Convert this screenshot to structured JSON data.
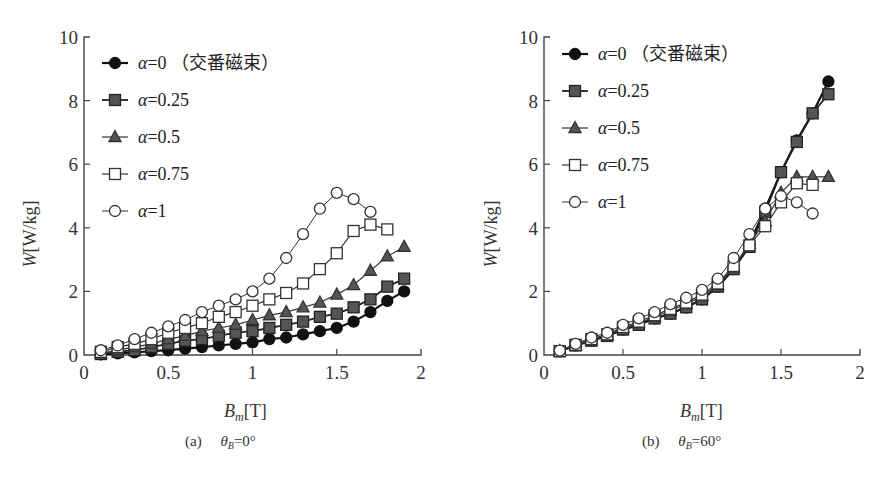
{
  "chart_data": [
    {
      "type": "line",
      "id": "a",
      "caption": "(a)",
      "caption_param_symbol": "θ",
      "caption_param_sub": "B",
      "caption_param_value": "=0°",
      "xlabel_main": "B",
      "xlabel_sub": "m",
      "xlabel_unit": "[T]",
      "ylabel_main": "W",
      "ylabel_unit": "[W/kg]",
      "xlim": [
        0,
        2
      ],
      "ylim": [
        0,
        10
      ],
      "xticks": [
        "0",
        "0.5",
        "1",
        "1.5",
        "2"
      ],
      "yticks": [
        "0",
        "2",
        "4",
        "6",
        "8",
        "10"
      ],
      "grid": false,
      "legend_position": "upper-left",
      "series": [
        {
          "name": "α=0 (交番磁束)",
          "marker": "filled-circle",
          "x": [
            0.1,
            0.2,
            0.3,
            0.4,
            0.5,
            0.6,
            0.7,
            0.8,
            0.9,
            1.0,
            1.1,
            1.2,
            1.3,
            1.4,
            1.5,
            1.6,
            1.7,
            1.8,
            1.9
          ],
          "values": [
            0.02,
            0.05,
            0.08,
            0.12,
            0.15,
            0.2,
            0.25,
            0.3,
            0.35,
            0.4,
            0.5,
            0.55,
            0.65,
            0.75,
            0.85,
            1.05,
            1.35,
            1.7,
            2.0
          ]
        },
        {
          "name": "α=0.25",
          "marker": "filled-square",
          "x": [
            0.1,
            0.2,
            0.3,
            0.4,
            0.5,
            0.6,
            0.7,
            0.8,
            0.9,
            1.0,
            1.1,
            1.2,
            1.3,
            1.4,
            1.5,
            1.6,
            1.7,
            1.8,
            1.9
          ],
          "values": [
            0.03,
            0.1,
            0.15,
            0.25,
            0.35,
            0.45,
            0.5,
            0.6,
            0.7,
            0.75,
            0.85,
            0.95,
            1.05,
            1.2,
            1.3,
            1.5,
            1.75,
            2.15,
            2.4
          ]
        },
        {
          "name": "α=0.5",
          "marker": "filled-triangle",
          "x": [
            0.1,
            0.2,
            0.3,
            0.4,
            0.5,
            0.6,
            0.7,
            0.8,
            0.9,
            1.0,
            1.1,
            1.2,
            1.3,
            1.4,
            1.5,
            1.6,
            1.7,
            1.8,
            1.9
          ],
          "values": [
            0.05,
            0.15,
            0.25,
            0.35,
            0.5,
            0.6,
            0.75,
            0.85,
            0.95,
            1.1,
            1.25,
            1.35,
            1.5,
            1.65,
            1.9,
            2.2,
            2.65,
            3.1,
            3.4
          ]
        },
        {
          "name": "α=0.75",
          "marker": "open-square",
          "x": [
            0.1,
            0.2,
            0.3,
            0.4,
            0.5,
            0.6,
            0.7,
            0.8,
            0.9,
            1.0,
            1.1,
            1.2,
            1.3,
            1.4,
            1.5,
            1.6,
            1.7,
            1.8
          ],
          "values": [
            0.1,
            0.25,
            0.35,
            0.5,
            0.7,
            0.85,
            1.0,
            1.2,
            1.35,
            1.55,
            1.75,
            1.95,
            2.25,
            2.7,
            3.2,
            3.9,
            4.1,
            3.95
          ]
        },
        {
          "name": "α=1",
          "marker": "open-circle",
          "x": [
            0.1,
            0.2,
            0.3,
            0.4,
            0.5,
            0.6,
            0.7,
            0.8,
            0.9,
            1.0,
            1.1,
            1.2,
            1.3,
            1.4,
            1.5,
            1.6,
            1.7
          ],
          "values": [
            0.15,
            0.3,
            0.5,
            0.7,
            0.9,
            1.1,
            1.35,
            1.55,
            1.75,
            2.0,
            2.4,
            3.05,
            3.8,
            4.6,
            5.1,
            4.9,
            4.5
          ]
        }
      ]
    },
    {
      "type": "line",
      "id": "b",
      "caption": "(b)",
      "caption_param_symbol": "θ",
      "caption_param_sub": "B",
      "caption_param_value": "=60°",
      "xlabel_main": "B",
      "xlabel_sub": "m",
      "xlabel_unit": "[T]",
      "ylabel_main": "W",
      "ylabel_unit": "[W/kg]",
      "xlim": [
        0,
        2
      ],
      "ylim": [
        0,
        10
      ],
      "xticks": [
        "0",
        "0.5",
        "1",
        "1.5",
        "2"
      ],
      "yticks": [
        "0",
        "2",
        "4",
        "6",
        "8",
        "10"
      ],
      "grid": false,
      "legend_position": "upper-left",
      "series": [
        {
          "name": "α=0 (交番磁束)",
          "marker": "filled-circle",
          "x": [
            0.1,
            0.2,
            0.3,
            0.4,
            0.5,
            0.6,
            0.7,
            0.8,
            0.9,
            1.0,
            1.1,
            1.2,
            1.3,
            1.4,
            1.5,
            1.6,
            1.7,
            1.8
          ],
          "values": [
            0.12,
            0.3,
            0.45,
            0.6,
            0.8,
            0.95,
            1.15,
            1.3,
            1.5,
            1.75,
            2.15,
            2.7,
            3.5,
            4.6,
            5.75,
            6.75,
            7.6,
            8.6
          ]
        },
        {
          "name": "α=0.25",
          "marker": "filled-square",
          "x": [
            0.1,
            0.2,
            0.3,
            0.4,
            0.5,
            0.6,
            0.7,
            0.8,
            0.9,
            1.0,
            1.1,
            1.2,
            1.3,
            1.4,
            1.5,
            1.6,
            1.7,
            1.8
          ],
          "values": [
            0.12,
            0.3,
            0.45,
            0.6,
            0.8,
            0.95,
            1.15,
            1.3,
            1.5,
            1.75,
            2.15,
            2.7,
            3.4,
            4.5,
            5.75,
            6.7,
            7.6,
            8.2
          ]
        },
        {
          "name": "α=0.5",
          "marker": "filled-triangle",
          "x": [
            0.1,
            0.2,
            0.3,
            0.4,
            0.5,
            0.6,
            0.7,
            0.8,
            0.9,
            1.0,
            1.1,
            1.2,
            1.3,
            1.4,
            1.5,
            1.6,
            1.7,
            1.8
          ],
          "values": [
            0.12,
            0.3,
            0.47,
            0.62,
            0.85,
            1.0,
            1.2,
            1.4,
            1.6,
            1.85,
            2.2,
            2.75,
            3.5,
            4.2,
            5.1,
            5.6,
            5.6,
            5.6
          ]
        },
        {
          "name": "α=0.75",
          "marker": "open-square",
          "x": [
            0.1,
            0.2,
            0.3,
            0.4,
            0.5,
            0.6,
            0.7,
            0.8,
            0.9,
            1.0,
            1.1,
            1.2,
            1.3,
            1.4,
            1.5,
            1.6,
            1.7
          ],
          "values": [
            0.12,
            0.32,
            0.5,
            0.65,
            0.88,
            1.05,
            1.25,
            1.45,
            1.65,
            1.9,
            2.25,
            2.8,
            3.45,
            4.05,
            4.8,
            5.4,
            5.35
          ]
        },
        {
          "name": "α=1",
          "marker": "open-circle",
          "x": [
            0.1,
            0.2,
            0.3,
            0.4,
            0.5,
            0.6,
            0.7,
            0.8,
            0.9,
            1.0,
            1.1,
            1.2,
            1.3,
            1.4,
            1.5,
            1.6,
            1.7
          ],
          "values": [
            0.14,
            0.35,
            0.55,
            0.7,
            0.95,
            1.15,
            1.35,
            1.6,
            1.8,
            2.05,
            2.4,
            3.05,
            3.8,
            4.6,
            5.0,
            4.8,
            4.45
          ]
        }
      ]
    }
  ]
}
